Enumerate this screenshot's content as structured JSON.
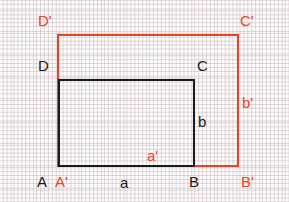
{
  "figure": {
    "kind": "geometry-diagram",
    "background_color": "#fdfdfd",
    "grid": {
      "visible": true,
      "style": "dashed",
      "color": "#beaaac",
      "spacing_px": 22.5
    },
    "colors": {
      "black": "#1a1a1a",
      "red": "#e8442c"
    }
  },
  "shapes": [
    {
      "id": "outer-rectangle",
      "name": "rectangle-A-prime-B-prime-C-prime-D-prime",
      "color": "#e8442c",
      "x": 57,
      "y": 34,
      "width": 182,
      "height": 133
    },
    {
      "id": "inner-rectangle",
      "name": "rectangle-A-B-C-D",
      "color": "#1a1a1a",
      "x": 58,
      "y": 79,
      "width": 137,
      "height": 88
    }
  ],
  "labels": {
    "vertices": [
      {
        "id": "D-prime",
        "text": "D'",
        "color": "red",
        "x": 38,
        "y": 13
      },
      {
        "id": "C-prime",
        "text": "C'",
        "color": "red",
        "x": 240,
        "y": 13
      },
      {
        "id": "D",
        "text": "D",
        "color": "black",
        "x": 38,
        "y": 58
      },
      {
        "id": "C",
        "text": "C",
        "color": "black",
        "x": 197,
        "y": 58
      },
      {
        "id": "A",
        "text": "A",
        "color": "black",
        "x": 37,
        "y": 174
      },
      {
        "id": "A-prime",
        "text": "A'",
        "color": "red",
        "x": 55,
        "y": 174
      },
      {
        "id": "B",
        "text": "B",
        "color": "black",
        "x": 189,
        "y": 174
      },
      {
        "id": "B-prime",
        "text": "B'",
        "color": "red",
        "x": 241,
        "y": 174
      }
    ],
    "sides": [
      {
        "id": "side-a",
        "text": "a",
        "color": "black",
        "x": 120,
        "y": 175
      },
      {
        "id": "side-a-prime",
        "text": "a'",
        "color": "red",
        "x": 147,
        "y": 148
      },
      {
        "id": "side-b",
        "text": "b",
        "color": "black",
        "x": 198,
        "y": 114
      },
      {
        "id": "side-b-prime",
        "text": "b'",
        "color": "red",
        "x": 242,
        "y": 95
      }
    ]
  }
}
